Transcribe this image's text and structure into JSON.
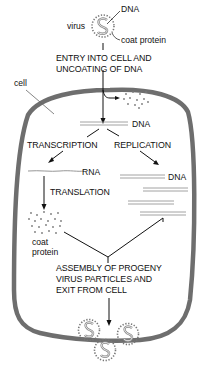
{
  "diagram": {
    "type": "viral-life-cycle",
    "labels": {
      "virus": "virus",
      "dna_top": "DNA",
      "coat_protein_top": "coat protein",
      "entry_line1": "ENTRY INTO CELL AND",
      "entry_line2": "UNCOATING OF DNA",
      "cell": "cell",
      "dna_center": "DNA",
      "transcription": "TRANSCRIPTION",
      "replication": "REPLICATION",
      "rna": "RNA",
      "dna_replicated": "DNA",
      "translation": "TRANSLATION",
      "coat_protein_line1": "coat",
      "coat_protein_line2": "protein",
      "assembly_line1": "ASSEMBLY OF PROGENY",
      "assembly_line2": "VIRUS PARTICLES AND",
      "assembly_line3": "EXIT FROM CELL"
    },
    "colors": {
      "cell_membrane": "#6e6e6e",
      "lines": "#111111",
      "dna_strand": "#8a8a8a",
      "protein_dots": "#7a7a7a"
    },
    "progeny_virus_count": 3
  }
}
